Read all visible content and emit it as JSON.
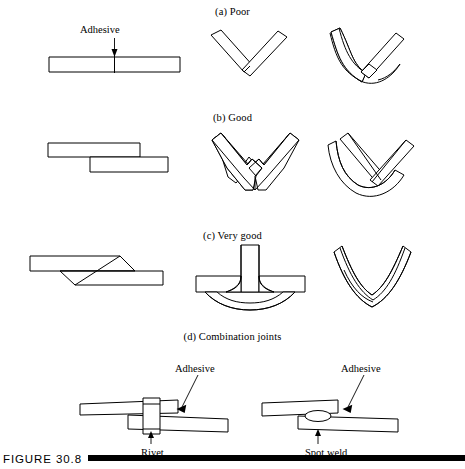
{
  "figure": {
    "caption": "FIGURE 30.8",
    "rule_color": "#000000",
    "line_color": "#000000",
    "background": "#ffffff"
  },
  "rows": [
    {
      "id": "a",
      "heading": "(a) Poor"
    },
    {
      "id": "b",
      "heading": "(b) Good"
    },
    {
      "id": "c",
      "heading": "(c) Very good"
    },
    {
      "id": "d",
      "heading": "(d) Combination joints"
    }
  ],
  "labels": {
    "adhesive_top": "Adhesive",
    "adhesive_rivet": "Adhesive",
    "adhesive_spotweld": "Adhesive",
    "rivet": "Rivet",
    "spot_weld": "Spot weld"
  },
  "diagrams": [
    {
      "name": "butt-joint-flat-strip",
      "row": "a",
      "description": "flat strip with thin adhesive line at center"
    },
    {
      "name": "v-joint-straight-bars",
      "row": "a",
      "description": "two straight bars butted at a V angle"
    },
    {
      "name": "v-joint-bent-bar-overlap",
      "row": "a",
      "description": "bent bar with straight bar lapped at the bend"
    },
    {
      "name": "lap-joint-offset",
      "row": "b",
      "description": "two flat strips overlapping offset"
    },
    {
      "name": "v-bracket-notched-seats",
      "row": "b",
      "description": "V bracket with stepped seats receiving two arms"
    },
    {
      "name": "v-channel-cradle",
      "row": "b",
      "description": "curved V channel cradling a straight V insert"
    },
    {
      "name": "scarf-joint-tapered",
      "row": "c",
      "description": "tapered scarf joint between two strips"
    },
    {
      "name": "t-joint-filleted",
      "row": "c",
      "description": "T joint with adhesive fillets and lower doubler"
    },
    {
      "name": "curved-v-scarf",
      "row": "c",
      "description": "curved V with tapered inner scarf"
    },
    {
      "name": "combination-rivet-joint",
      "row": "d",
      "description": "lap joint bonded with adhesive and a rivet"
    },
    {
      "name": "combination-spotweld-joint",
      "row": "d",
      "description": "lap joint bonded with adhesive and a spot weld nugget"
    }
  ]
}
